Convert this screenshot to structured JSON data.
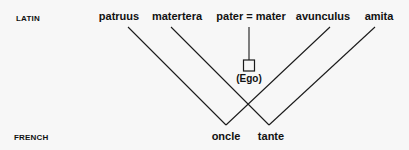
{
  "rows": {
    "top_label": "LATIN",
    "bottom_label": "FRENCH"
  },
  "latin_terms": {
    "patruus": "patruus",
    "matertera": "matertera",
    "parents": "pater = mater",
    "avunculus": "avunculus",
    "amita": "amita"
  },
  "ego": {
    "label": "(Ego)"
  },
  "french_terms": {
    "oncle": "oncle",
    "tante": "tante"
  },
  "links": [
    {
      "from": "patruus",
      "to": "oncle"
    },
    {
      "from": "avunculus",
      "to": "oncle"
    },
    {
      "from": "matertera",
      "to": "tante"
    },
    {
      "from": "amita",
      "to": "tante"
    },
    {
      "from": "pater = mater",
      "to": "(Ego)"
    }
  ],
  "colors": {
    "line": "#1a1a1a",
    "text": "#111111",
    "background": "#f7f7f7"
  }
}
